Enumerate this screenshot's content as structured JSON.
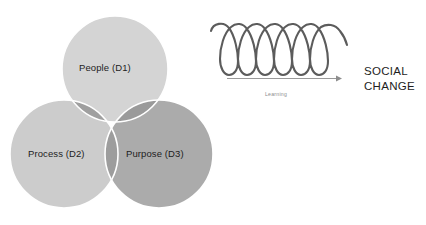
{
  "figure": {
    "background_color": "#ffffff",
    "width": 426,
    "height": 225
  },
  "venn": {
    "title": "",
    "outline_color": "#ffffff",
    "circles": [
      {
        "id": "D1",
        "label": "People (D1)",
        "position": "top",
        "fill": "#d2d2d2",
        "cx": 115,
        "cy": 69,
        "r": 53
      },
      {
        "id": "D2",
        "label": "Process (D2)",
        "position": "bottom-left",
        "fill": "#cbcbcb",
        "cx": 64,
        "cy": 154,
        "r": 54
      },
      {
        "id": "D3",
        "label": "Purpose (D3)",
        "position": "bottom-right",
        "fill": "#adadad",
        "cx": 159,
        "cy": 154,
        "r": 54
      }
    ]
  },
  "spiral": {
    "coil_count": 6,
    "stroke_color": "#5c5c5c",
    "stroke_width": 2.1,
    "arrow": {
      "label": "Learning",
      "color": "#8d8d8d",
      "direction": "right"
    }
  },
  "outcome": {
    "line1": "SOCIAL",
    "line2": "CHANGE",
    "color": "#1d1d1d"
  }
}
